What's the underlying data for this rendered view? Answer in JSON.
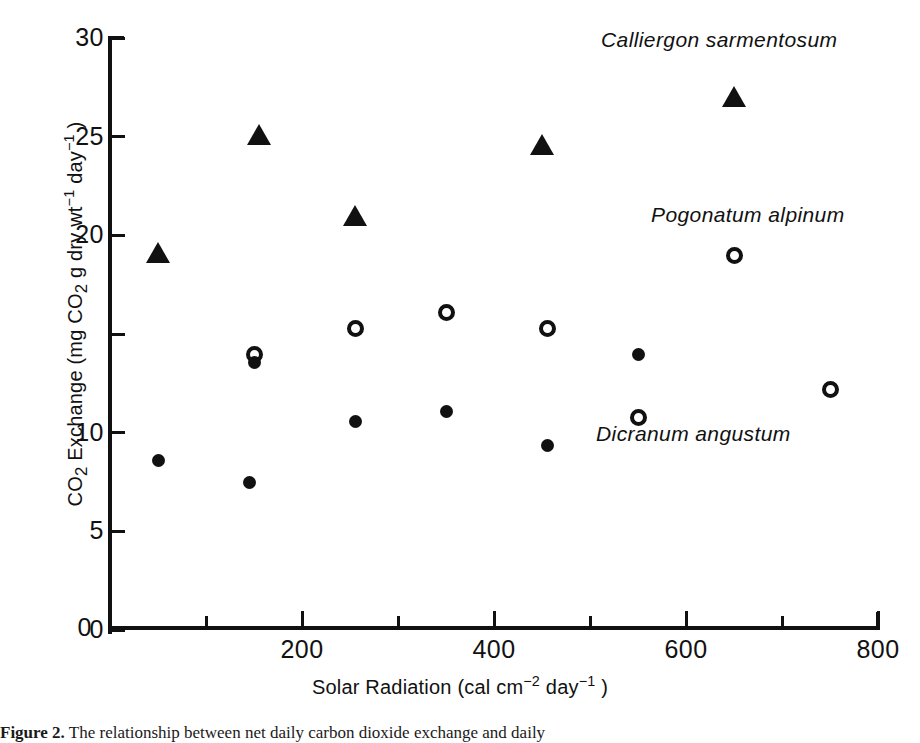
{
  "chart_data": {
    "type": "scatter",
    "title": "",
    "xlabel": "Solar Radiation (cal cm−2 day−1)",
    "ylabel": "CO2 Exchange (mg CO2 g dry wt−1 day−1)",
    "xlim": [
      0,
      800
    ],
    "ylim": [
      0,
      30
    ],
    "xticks": [
      0,
      100,
      200,
      300,
      400,
      500,
      600,
      700,
      800
    ],
    "xtick_labels_major": [
      "0",
      "200",
      "400",
      "600",
      "800"
    ],
    "yticks": [
      0,
      5,
      10,
      15,
      20,
      25,
      30
    ],
    "ytick_labels": [
      "0",
      "5",
      "10",
      "15",
      "20",
      "25",
      "30"
    ],
    "grid": false,
    "legend": "inline-annotations",
    "series": [
      {
        "name": "Calliergon sarmentosum",
        "marker": "filled-triangle",
        "color": "#111111",
        "points": [
          {
            "x": 50,
            "y": 19.1
          },
          {
            "x": 155,
            "y": 25.1
          },
          {
            "x": 255,
            "y": 21.0
          },
          {
            "x": 450,
            "y": 24.6
          },
          {
            "x": 650,
            "y": 27.0
          }
        ]
      },
      {
        "name": "Pogonatum alpinum",
        "marker": "open-circle",
        "color": "#111111",
        "points": [
          {
            "x": 150,
            "y": 14.0
          },
          {
            "x": 255,
            "y": 15.3
          },
          {
            "x": 350,
            "y": 16.1
          },
          {
            "x": 455,
            "y": 15.3
          },
          {
            "x": 550,
            "y": 10.8
          },
          {
            "x": 650,
            "y": 19.0
          },
          {
            "x": 750,
            "y": 12.2
          }
        ]
      },
      {
        "name": "Dicranum angustum",
        "marker": "filled-circle",
        "color": "#111111",
        "points": [
          {
            "x": 50,
            "y": 8.6
          },
          {
            "x": 145,
            "y": 7.5
          },
          {
            "x": 150,
            "y": 13.6
          },
          {
            "x": 255,
            "y": 10.6
          },
          {
            "x": 350,
            "y": 11.1
          },
          {
            "x": 455,
            "y": 9.4
          },
          {
            "x": 550,
            "y": 14.0
          }
        ]
      }
    ],
    "annotations": [
      {
        "text": "Calliergon sarmentosum",
        "x_px": 601,
        "y_px": 28,
        "italic": true
      },
      {
        "text": "Pogonatum alpinum",
        "x_px": 651,
        "y_px": 203,
        "italic": true
      },
      {
        "text": "Dicranum angustum",
        "x_px": 596,
        "y_px": 422,
        "italic": true
      }
    ]
  },
  "axis_titles": {
    "y_part1": "CO",
    "y_sub1": "2",
    "y_part2": " Exchange (mg CO",
    "y_sub2": "2",
    "y_part3": " g dry wt",
    "y_exp1": "−1",
    "y_part4": " day",
    "y_exp2": "−1",
    "y_part5": " )",
    "x_part1": "Solar Radiation (cal cm",
    "x_exp1": "−2",
    "x_part2": " day",
    "x_exp2": "−1",
    "x_part3": " )"
  },
  "caption": {
    "figure_number": "Figure 2.",
    "text": "The relationship between net daily carbon dioxide exchange and daily"
  }
}
